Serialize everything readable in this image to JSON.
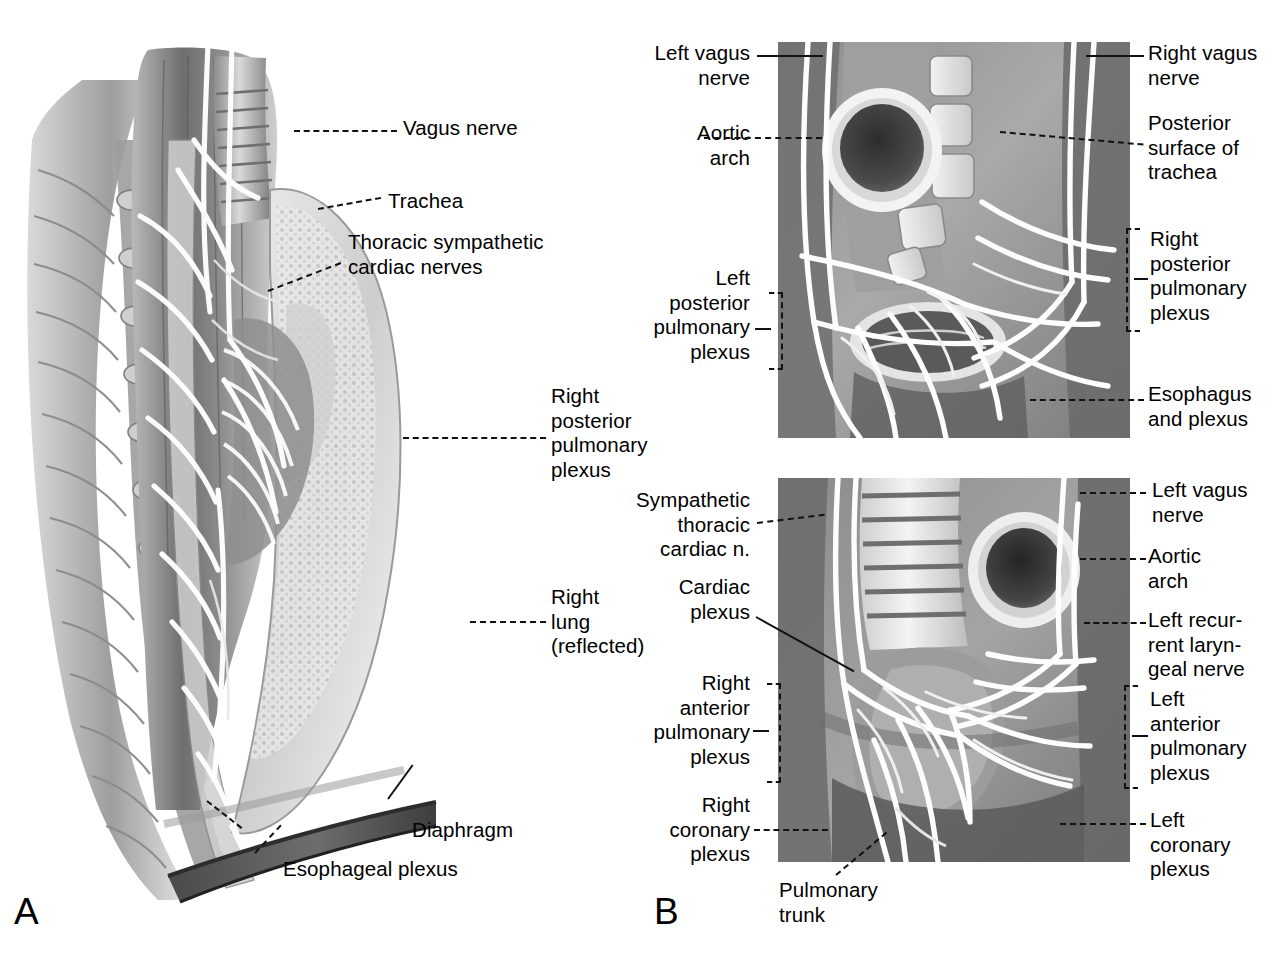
{
  "figure": {
    "kind": "anatomical-illustration",
    "panels": [
      {
        "letter": "A",
        "caption": "Right lateral view of the posterior mediastinum with the right lung reflected"
      },
      {
        "letter": "B",
        "caption": "Posterior (upper) and anterior (lower) views of the mediastinal nerve plexuses"
      }
    ],
    "style": {
      "line_color": "#111111",
      "background": "#ffffff",
      "ink": "grayscale-halftone"
    }
  },
  "panel_a": {
    "letter": "A",
    "labels": [
      {
        "id": "vagus-nerve",
        "text": "Vagus nerve",
        "align": "left"
      },
      {
        "id": "trachea",
        "text": "Trachea",
        "align": "left"
      },
      {
        "id": "thoracic-sympathetic-cardiac-nerves",
        "text": "Thoracic sympathetic\ncardiac nerves",
        "align": "left"
      },
      {
        "id": "right-posterior-pulmonary-plexus",
        "text": "Right\nposterior\npulmonary\nplexus",
        "align": "left"
      },
      {
        "id": "right-lung-reflected",
        "text": "Right\nlung\n(reflected)",
        "align": "left"
      },
      {
        "id": "diaphragm",
        "text": "Diaphragm",
        "align": "left"
      },
      {
        "id": "esophageal-plexus",
        "text": "Esophageal plexus",
        "align": "left"
      }
    ]
  },
  "panel_b": {
    "letter": "B",
    "upper": {
      "labels_left": [
        {
          "id": "left-vagus-nerve",
          "text": "Left vagus\nnerve"
        },
        {
          "id": "aortic-arch",
          "text": "Aortic\narch"
        },
        {
          "id": "left-posterior-pulmonary-plexus",
          "text": "Left\nposterior\npulmonary\nplexus",
          "bracket": true
        }
      ],
      "labels_right": [
        {
          "id": "right-vagus-nerve",
          "text": "Right vagus\nnerve"
        },
        {
          "id": "posterior-surface-of-trachea",
          "text": "Posterior\nsurface of\ntrachea"
        },
        {
          "id": "right-posterior-pulmonary-plexus",
          "text": "Right\nposterior\npulmonary\nplexus",
          "bracket": true
        },
        {
          "id": "esophagus-and-plexus",
          "text": "Esophagus\nand plexus"
        }
      ]
    },
    "lower": {
      "labels_left": [
        {
          "id": "sympathetic-thoracic-cardiac-n",
          "text": "Sympathetic\nthoracic\ncardiac n."
        },
        {
          "id": "cardiac-plexus",
          "text": "Cardiac\nplexus"
        },
        {
          "id": "right-anterior-pulmonary-plexus",
          "text": "Right\nanterior\npulmonary\nplexus",
          "bracket": true
        },
        {
          "id": "right-coronary-plexus",
          "text": "Right\ncoronary\nplexus"
        }
      ],
      "labels_right": [
        {
          "id": "left-vagus-nerve",
          "text": "Left vagus\nnerve"
        },
        {
          "id": "aortic-arch",
          "text": "Aortic\narch"
        },
        {
          "id": "left-recurrent-laryngeal-nerve",
          "text": "Left recur-\nrent laryn-\ngeal nerve"
        },
        {
          "id": "left-anterior-pulmonary-plexus",
          "text": "Left\nanterior\npulmonary\nplexus",
          "bracket": true
        },
        {
          "id": "left-coronary-plexus",
          "text": "Left\ncoronary\nplexus"
        }
      ],
      "labels_bottom": [
        {
          "id": "pulmonary-trunk",
          "text": "Pulmonary\ntrunk"
        }
      ]
    }
  }
}
